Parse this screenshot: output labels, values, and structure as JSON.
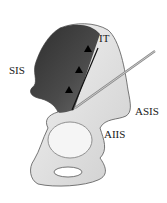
{
  "figure": {
    "labels": {
      "it": "IT",
      "sis": "SIS",
      "asis": "ASIS",
      "aiis": "AIIS"
    },
    "markers": {
      "triangle_count": 3
    },
    "colors": {
      "bone_dark": "#3a3a3a",
      "bone_light": "#e8e8e8",
      "line": "#111111",
      "needle": "#9a9a9a"
    }
  }
}
